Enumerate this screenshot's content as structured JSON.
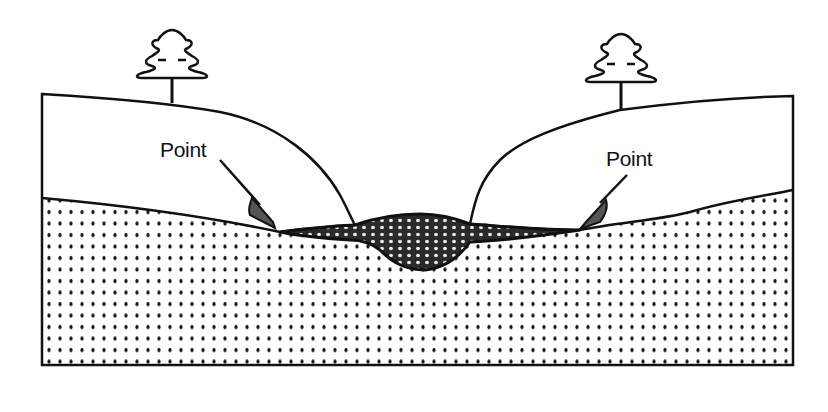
{
  "diagram": {
    "labels": {
      "left_point": "Point",
      "right_point": "Point"
    },
    "colors": {
      "ink": "#111111",
      "background": "#ffffff",
      "stream_fill": "#2a2a2a",
      "stream_speckle": "#e8e8e8",
      "ground_dot": "#1a1a1a"
    },
    "elements": [
      {
        "name": "left-tree",
        "type": "tree-icon"
      },
      {
        "name": "right-tree",
        "type": "tree-icon"
      },
      {
        "name": "upper-soil-layer",
        "type": "region"
      },
      {
        "name": "lower-dotted-layer",
        "type": "region"
      },
      {
        "name": "stream-channel",
        "type": "region"
      },
      {
        "name": "left-arrow",
        "type": "arrow",
        "label_ref": "left_point"
      },
      {
        "name": "right-arrow",
        "type": "arrow",
        "label_ref": "right_point"
      }
    ]
  }
}
